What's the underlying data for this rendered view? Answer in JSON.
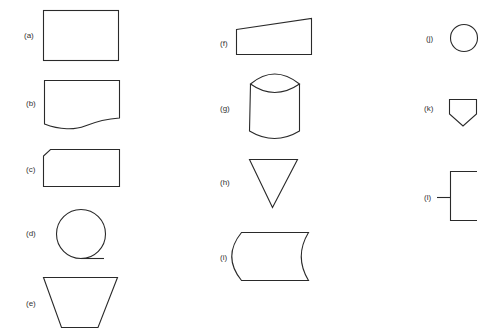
{
  "figure": {
    "title": "",
    "stroke_color": "#2a2a2a",
    "label_color": "#333333",
    "background": "#ffffff"
  },
  "shapes": [
    {
      "id": "a",
      "label": "(a)",
      "kind": "rectangle"
    },
    {
      "id": "b",
      "label": "(b)",
      "kind": "document"
    },
    {
      "id": "c",
      "label": "(c)",
      "kind": "clipped-corner-rectangle"
    },
    {
      "id": "d",
      "label": "(d)",
      "kind": "circle-with-tangent-tail"
    },
    {
      "id": "e",
      "label": "(e)",
      "kind": "inverted-trapezoid"
    },
    {
      "id": "f",
      "label": "(f)",
      "kind": "manual-input"
    },
    {
      "id": "g",
      "label": "(g)",
      "kind": "cylinder-lens"
    },
    {
      "id": "h",
      "label": "(h)",
      "kind": "inverted-triangle"
    },
    {
      "id": "i",
      "label": "(i)",
      "kind": "stored-data"
    },
    {
      "id": "j",
      "label": "(j)",
      "kind": "small-circle"
    },
    {
      "id": "k",
      "label": "(k)",
      "kind": "pentagon-offpage"
    },
    {
      "id": "l",
      "label": "(l)",
      "kind": "annotation-bracket"
    }
  ]
}
